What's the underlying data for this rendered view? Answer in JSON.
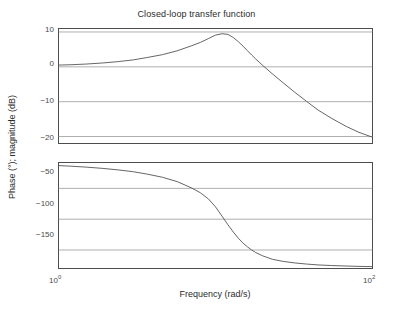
{
  "figure": {
    "title": "Closed-loop transfer function",
    "xlabel": "Frequency (rad/s)",
    "ylabel": "Phase (°); magnitude (dB)",
    "axis_color": "#4d4d4d",
    "grid_color": "#8c8c8c",
    "curve_color": "#555555",
    "background": "#ffffff"
  },
  "xticks": [
    {
      "base": "10",
      "exp": "0"
    },
    {
      "base": "10",
      "exp": "2"
    }
  ],
  "magnitude_yticks": [
    "10",
    "0",
    "−10",
    "−20"
  ],
  "phase_yticks": [
    "−50",
    "−100",
    "−150"
  ],
  "chart_data": [
    {
      "type": "line",
      "title": "Closed-loop transfer function",
      "subtitle": "magnitude",
      "xlabel": "Frequency (rad/s)",
      "ylabel": "magnitude (dB)",
      "xscale": "log",
      "xlim": [
        1,
        100
      ],
      "ylim": [
        -22,
        11
      ],
      "yticks": [
        10,
        0,
        -10,
        -20
      ],
      "grid": true,
      "legend": "none",
      "series": [
        {
          "name": "magnitude",
          "x": [
            1.0,
            1.2,
            1.5,
            1.9,
            2.4,
            3.0,
            3.7,
            4.6,
            5.7,
            7.0,
            8.0,
            9.0,
            10.0,
            11.0,
            12.0,
            13.0,
            14.0,
            15.0,
            16.0,
            17.0,
            18.0,
            20.0,
            23.0,
            27.0,
            32.0,
            38.0,
            45.0,
            55.0,
            68.0,
            82.0,
            100.0
          ],
          "y": [
            0.5,
            0.6,
            0.8,
            1.1,
            1.5,
            2.0,
            2.7,
            3.5,
            4.6,
            6.0,
            7.0,
            8.1,
            9.1,
            9.5,
            9.3,
            8.4,
            7.2,
            5.9,
            4.6,
            3.4,
            2.3,
            0.4,
            -2.0,
            -4.6,
            -7.3,
            -9.9,
            -12.4,
            -14.8,
            -17.1,
            -18.8,
            -20.2
          ]
        }
      ]
    },
    {
      "type": "line",
      "subtitle": "phase",
      "xlabel": "Frequency (rad/s)",
      "ylabel": "Phase (°)",
      "xscale": "log",
      "xlim": [
        1,
        100
      ],
      "ylim": [
        -180,
        -8
      ],
      "yticks": [
        -50,
        -100,
        -150
      ],
      "grid": true,
      "legend": "none",
      "series": [
        {
          "name": "phase",
          "x": [
            1.0,
            1.2,
            1.5,
            1.9,
            2.4,
            3.0,
            3.7,
            4.6,
            5.7,
            7.0,
            8.0,
            9.0,
            10.0,
            11.0,
            12.0,
            13.0,
            14.0,
            15.0,
            16.0,
            17.0,
            18.0,
            20.0,
            23.0,
            27.0,
            32.0,
            38.0,
            45.0,
            55.0,
            68.0,
            82.0,
            100.0
          ],
          "y": [
            -13.0,
            -14.0,
            -15.5,
            -17.5,
            -20.0,
            -23.0,
            -27.0,
            -32.0,
            -39.0,
            -49.0,
            -57.0,
            -67.0,
            -80.0,
            -95.0,
            -109.0,
            -121.0,
            -131.0,
            -139.0,
            -145.0,
            -150.0,
            -154.0,
            -159.5,
            -165.0,
            -168.5,
            -171.0,
            -172.8,
            -174.2,
            -175.2,
            -176.0,
            -176.6,
            -177.0
          ]
        }
      ]
    }
  ]
}
